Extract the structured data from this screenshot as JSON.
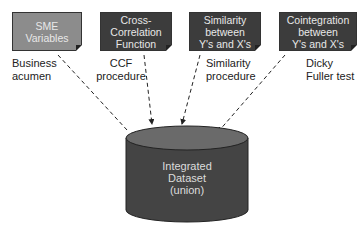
{
  "boxes": [
    {
      "id": "sme",
      "lines": [
        "SME",
        "Variables"
      ],
      "fill": "#8c8c8c",
      "label": [
        "Business",
        "acumen"
      ]
    },
    {
      "id": "ccf",
      "lines": [
        "Cross-",
        "Correlation",
        "Function"
      ],
      "fill": "#3c3c3c",
      "label": [
        "CCF",
        "procedure"
      ]
    },
    {
      "id": "sim",
      "lines": [
        "Similarity",
        "between",
        "Y's and X's"
      ],
      "fill": "#3c3c3c",
      "label": [
        "Similarity",
        "procedure"
      ]
    },
    {
      "id": "coint",
      "lines": [
        "Cointegration",
        "between",
        "Y's and X's"
      ],
      "fill": "#3c3c3c",
      "label": [
        "Dicky",
        "Fuller test"
      ]
    }
  ],
  "target": {
    "lines": [
      "Integrated",
      "Dataset",
      "(union)"
    ],
    "fill": "#444444"
  }
}
